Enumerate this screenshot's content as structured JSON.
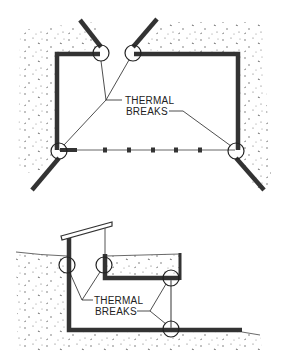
{
  "figure": {
    "top_diagram": {
      "label_line1": "THERMAL",
      "label_line2": "BREAKS",
      "description": "Plan view of building with thermal breaks at wall corners"
    },
    "bottom_diagram": {
      "label_line1": "THERMAL",
      "label_line2": "BREAKS",
      "description": "Section view of earth-sheltered structure with thermal breaks"
    },
    "colors": {
      "wall": "#333333",
      "soil_dots": "#555555",
      "background": "#ffffff"
    }
  }
}
